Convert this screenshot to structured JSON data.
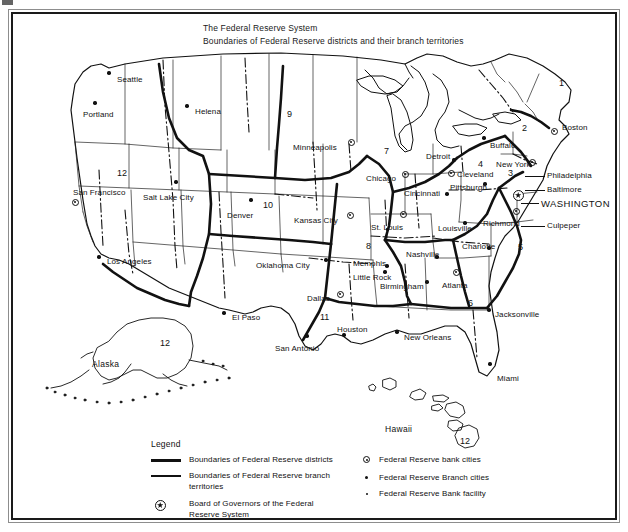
{
  "document": {
    "kind": "map",
    "title_lines": [
      "The Federal Reserve System",
      "Boundaries of Federal Reserve districts and their branch territories"
    ]
  },
  "map": {
    "districts": [
      {
        "number": "1",
        "x": 546,
        "y": 65,
        "name": "Boston"
      },
      {
        "number": "2",
        "x": 509,
        "y": 110,
        "name": "New York"
      },
      {
        "number": "3",
        "x": 495,
        "y": 155,
        "name": "Philadelphia"
      },
      {
        "number": "4",
        "x": 465,
        "y": 146,
        "name": "Cleveland"
      },
      {
        "number": "5",
        "x": 505,
        "y": 229,
        "name": "Richmond"
      },
      {
        "number": "6",
        "x": 455,
        "y": 285,
        "name": "Atlanta"
      },
      {
        "number": "7",
        "x": 371,
        "y": 133,
        "name": "Chicago"
      },
      {
        "number": "8",
        "x": 353,
        "y": 228,
        "name": "St. Louis"
      },
      {
        "number": "9",
        "x": 274,
        "y": 96,
        "name": "Minneapolis"
      },
      {
        "number": "10",
        "x": 250,
        "y": 187,
        "name": "Kansas City"
      },
      {
        "number": "11",
        "x": 307,
        "y": 299,
        "name": "Dallas"
      },
      {
        "number": "12",
        "x": 104,
        "y": 155,
        "name": "San Francisco"
      },
      {
        "number": "12",
        "x": 147,
        "y": 325,
        "name": "Alaska"
      },
      {
        "number": "12",
        "x": 447,
        "y": 423,
        "name": "Hawaii"
      }
    ],
    "insets": [
      {
        "label": "Alaska",
        "x": 79,
        "y": 345
      },
      {
        "label": "Hawaii",
        "x": 372,
        "y": 410
      }
    ],
    "cities": [
      {
        "label": "Seattle",
        "type": "branch",
        "lx": 104,
        "ly": 62,
        "mx": 96,
        "my": 59,
        "align": "left"
      },
      {
        "label": "Portland",
        "type": "branch",
        "lx": 70,
        "ly": 97,
        "mx": 82,
        "my": 89,
        "align": "left"
      },
      {
        "label": "Helena",
        "type": "branch",
        "lx": 182,
        "ly": 94,
        "mx": 174,
        "my": 92,
        "align": "left"
      },
      {
        "label": "San Francisco",
        "type": "bank",
        "lx": 60,
        "ly": 175,
        "mx": 62,
        "my": 188,
        "align": "left"
      },
      {
        "label": "Salt Lake City",
        "type": "branch",
        "lx": 130,
        "ly": 180,
        "mx": 163,
        "my": 168,
        "align": "left"
      },
      {
        "label": "Los Angeles",
        "type": "branch",
        "lx": 94,
        "ly": 244,
        "mx": 86,
        "my": 243,
        "align": "left"
      },
      {
        "label": "Denver",
        "type": "branch",
        "lx": 214,
        "ly": 198,
        "mx": 238,
        "my": 186,
        "align": "left"
      },
      {
        "label": "Minneapolis",
        "type": "bank",
        "lx": 280,
        "ly": 130,
        "mx": 338,
        "my": 128,
        "align": "left"
      },
      {
        "label": "Kansas City",
        "type": "bank",
        "lx": 281,
        "ly": 203,
        "mx": 337,
        "my": 201,
        "align": "left"
      },
      {
        "label": "Oklahoma City",
        "type": "branch",
        "lx": 243,
        "ly": 248,
        "mx": 313,
        "my": 246,
        "align": "left"
      },
      {
        "label": "Dallas",
        "type": "bank",
        "lx": 294,
        "ly": 281,
        "mx": 327,
        "my": 280,
        "align": "left"
      },
      {
        "label": "El Paso",
        "type": "branch",
        "lx": 219,
        "ly": 300,
        "mx": 211,
        "my": 299,
        "align": "left"
      },
      {
        "label": "San Antonio",
        "type": "branch",
        "lx": 262,
        "ly": 331,
        "mx": 294,
        "my": 322,
        "align": "left"
      },
      {
        "label": "Houston",
        "type": "branch",
        "lx": 324,
        "ly": 312,
        "mx": 331,
        "my": 321,
        "align": "left"
      },
      {
        "label": "New Orleans",
        "type": "branch",
        "lx": 391,
        "ly": 320,
        "mx": 384,
        "my": 318,
        "align": "left"
      },
      {
        "label": "Little Rock",
        "type": "branch",
        "lx": 340,
        "ly": 260,
        "mx": 372,
        "my": 258,
        "align": "left"
      },
      {
        "label": "Memphis",
        "type": "branch",
        "lx": 340,
        "ly": 246,
        "mx": 374,
        "my": 252,
        "align": "left"
      },
      {
        "label": "St. Louis",
        "type": "bank",
        "lx": 358,
        "ly": 210,
        "mx": 390,
        "my": 200,
        "align": "left"
      },
      {
        "label": "Chicago",
        "type": "bank",
        "lx": 353,
        "ly": 161,
        "mx": 392,
        "my": 160,
        "align": "left"
      },
      {
        "label": "Detroit",
        "type": "branch",
        "lx": 413,
        "ly": 139,
        "mx": 441,
        "my": 146,
        "align": "left"
      },
      {
        "label": "Cincinnati",
        "type": "branch",
        "lx": 391,
        "ly": 176,
        "mx": 434,
        "my": 180,
        "align": "left"
      },
      {
        "label": "Louisville",
        "type": "branch",
        "lx": 425,
        "ly": 211,
        "mx": 452,
        "my": 209,
        "align": "left"
      },
      {
        "label": "Nashville",
        "type": "branch",
        "lx": 393,
        "ly": 237,
        "mx": 424,
        "my": 243,
        "align": "left"
      },
      {
        "label": "Birmingham",
        "type": "branch",
        "lx": 367,
        "ly": 269,
        "mx": 414,
        "my": 268,
        "align": "left"
      },
      {
        "label": "Atlanta",
        "type": "bank",
        "lx": 429,
        "ly": 268,
        "mx": 443,
        "my": 258,
        "align": "left"
      },
      {
        "label": "Jacksonville",
        "type": "branch",
        "lx": 482,
        "ly": 297,
        "mx": 476,
        "my": 296,
        "align": "left"
      },
      {
        "label": "Miami",
        "type": "branch",
        "lx": 484,
        "ly": 361,
        "mx": 477,
        "my": 350,
        "align": "left"
      },
      {
        "label": "Charlotte",
        "type": "branch",
        "lx": 449,
        "ly": 229,
        "mx": 476,
        "my": 234,
        "align": "left"
      },
      {
        "label": "Richmond",
        "type": "bank",
        "lx": 470,
        "ly": 206,
        "mx": 503,
        "my": 197,
        "align": "left"
      },
      {
        "label": "Cleveland",
        "type": "bank",
        "lx": 444,
        "ly": 157,
        "mx": 438,
        "my": 159,
        "align": "left"
      },
      {
        "label": "Pittsburgh",
        "type": "branch",
        "lx": 437,
        "ly": 170,
        "mx": 472,
        "my": 170,
        "align": "left"
      },
      {
        "label": "Buffalo",
        "type": "branch",
        "lx": 477,
        "ly": 128,
        "mx": 471,
        "my": 124,
        "align": "left"
      },
      {
        "label": "New York",
        "type": "bank",
        "lx": 483,
        "ly": 147,
        "mx": 519,
        "my": 148,
        "align": "left"
      },
      {
        "label": "Boston",
        "type": "bank",
        "lx": 549,
        "ly": 110,
        "mx": 541,
        "my": 117,
        "align": "left"
      },
      {
        "label": "Philadelphia",
        "type": "leader",
        "lx": 534,
        "ly": 158,
        "mx": 0,
        "my": 0,
        "align": "left"
      },
      {
        "label": "Baltimore",
        "type": "leader",
        "lx": 534,
        "ly": 172,
        "mx": 0,
        "my": 0,
        "align": "left"
      },
      {
        "label": "WASHINGTON",
        "type": "leader",
        "lx": 528,
        "ly": 185,
        "mx": 0,
        "my": 0,
        "align": "left"
      },
      {
        "label": "Culpeper",
        "type": "leader",
        "lx": 534,
        "ly": 208,
        "mx": 0,
        "my": 0,
        "align": "left"
      }
    ]
  },
  "legend": {
    "title": "Legend",
    "left_items": [
      {
        "symbol": "thick-rule",
        "text": "Boundaries of Federal Reserve districts"
      },
      {
        "symbol": "thin-rule",
        "text": "Boundaries of Federal Reserve branch"
      },
      {
        "symbol": "none",
        "text": "territories"
      },
      {
        "symbol": "star-circle",
        "text": "Board of Governors of the Federal"
      },
      {
        "symbol": "none",
        "text": "Reserve System"
      }
    ],
    "right_items": [
      {
        "symbol": "bank-dot",
        "text": "Federal Reserve bank cities"
      },
      {
        "symbol": "branch-dot",
        "text": "Federal Reserve Branch cities"
      },
      {
        "symbol": "facility-dot",
        "text": "Federal Reserve Bank facility"
      }
    ]
  },
  "colors": {
    "ink": "#111111",
    "frame_outer": "#8d8d8d",
    "frame_inner": "#1a1a1a",
    "paper": "#ffffff"
  }
}
